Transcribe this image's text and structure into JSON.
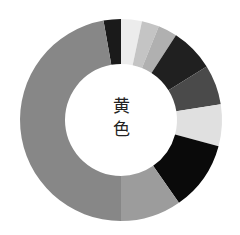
{
  "chart_data": {
    "type": "pie",
    "variant": "donut",
    "title": "",
    "center_label": "黄色",
    "start_angle_deg": -10,
    "direction": "clockwise",
    "geometry": {
      "cx": 121,
      "cy": 120,
      "outer_r": 101,
      "inner_r": 56
    },
    "segments": [
      {
        "label": "",
        "value": 10,
        "color": "#1a1a1a"
      },
      {
        "label": "",
        "value": 12,
        "color": "#ececec"
      },
      {
        "label": "",
        "value": 10,
        "color": "#c4c4c4"
      },
      {
        "label": "",
        "value": 11,
        "color": "#b0b0b0"
      },
      {
        "label": "",
        "value": 25,
        "color": "#202020"
      },
      {
        "label": "",
        "value": 23,
        "color": "#4a4a4a"
      },
      {
        "label": "",
        "value": 24,
        "color": "#e0e0e0"
      },
      {
        "label": "",
        "value": 40,
        "color": "#0a0a0a"
      },
      {
        "label": "",
        "value": 35,
        "color": "#9c9c9c"
      },
      {
        "label": "",
        "value": 170,
        "color": "#878787"
      }
    ]
  }
}
